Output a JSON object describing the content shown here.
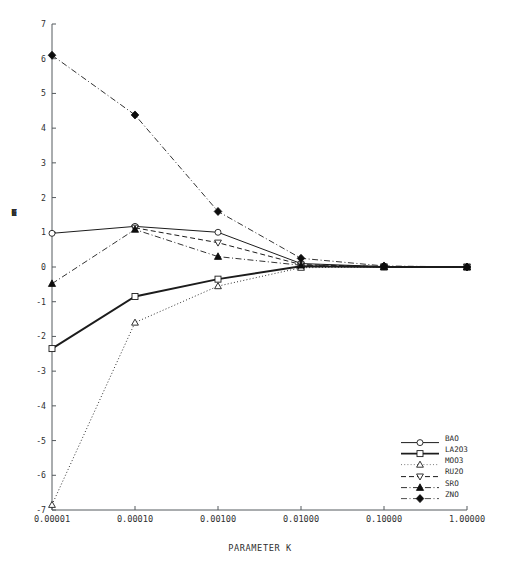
{
  "chart_data": {
    "type": "line",
    "title": "",
    "xlabel": "PARAMETER K",
    "ylabel": "COEFFICIENTS",
    "x_scale": "log",
    "x": [
      1e-05,
      0.0001,
      0.001,
      0.01,
      0.1,
      1.0
    ],
    "x_tick_labels": [
      "0.00001",
      "0.00010",
      "0.00100",
      "0.01000",
      "0.10000",
      "1.00000"
    ],
    "ylim": [
      -7,
      7
    ],
    "y_tick_labels": [
      "7",
      "6",
      "5",
      "4",
      "3",
      "2",
      "1",
      "0",
      "-1",
      "-2",
      "-3",
      "-4",
      "-5",
      "-6",
      "-7"
    ],
    "y_ticks": [
      7,
      6,
      5,
      4,
      3,
      2,
      1,
      0,
      -1,
      -2,
      -3,
      -4,
      -5,
      -6,
      -7
    ],
    "grid": false,
    "legend_position": "lower-right",
    "series": [
      {
        "name": "BAO",
        "values": [
          0.97,
          1.17,
          1.0,
          0.1,
          0.01,
          0.0
        ],
        "line_style": "solid",
        "marker": "open-circle",
        "color": "#1c1c1c",
        "width": 1.0
      },
      {
        "name": "LA2O3",
        "values": [
          -2.35,
          -0.85,
          -0.35,
          0.02,
          0.0,
          0.0
        ],
        "line_style": "solid",
        "marker": "open-square",
        "color": "#1c1c1c",
        "width": 1.9
      },
      {
        "name": "MOO3",
        "values": [
          -6.85,
          -1.6,
          -0.55,
          -0.02,
          0.0,
          0.0
        ],
        "line_style": "dotted",
        "marker": "open-triangle-up",
        "color": "#6f6f6f",
        "width": 0.9
      },
      {
        "name": "RU2O",
        "values": [
          null,
          1.13,
          0.7,
          0.07,
          0.01,
          0.0
        ],
        "line_style": "dashed",
        "marker": "open-triangle-down",
        "color": "#1c1c1c",
        "width": 1.0
      },
      {
        "name": "SRO",
        "values": [
          -0.48,
          1.08,
          0.3,
          0.05,
          0.01,
          0.0
        ],
        "line_style": "dash-dot",
        "marker": "filled-triangle-up",
        "color": "#1c1c1c",
        "width": 0.9
      },
      {
        "name": "ZNO",
        "values": [
          6.1,
          4.38,
          1.6,
          0.25,
          0.03,
          0.0
        ],
        "line_style": "dash-dot",
        "marker": "filled-diamond",
        "color": "#3c3c3c",
        "width": 0.9
      }
    ]
  },
  "axes": {
    "x_title": "PARAMETER K",
    "y_title_chars": [
      "C",
      "O",
      "E",
      "F",
      "F",
      "I",
      "C",
      "I",
      "E",
      "N",
      "T",
      "S"
    ]
  },
  "legend": {
    "entries": [
      {
        "label": "BAO"
      },
      {
        "label": "LA2O3"
      },
      {
        "label": "MOO3"
      },
      {
        "label": "RU2O"
      },
      {
        "label": "SRO"
      },
      {
        "label": "ZNO"
      }
    ]
  }
}
